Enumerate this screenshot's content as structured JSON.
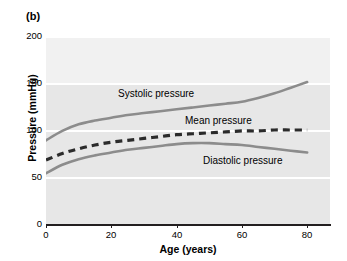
{
  "figure": {
    "panel_label": "(b)"
  },
  "chart_data": {
    "type": "line",
    "title": "",
    "subtitle": "",
    "xlabel": "Age (years)",
    "ylabel": "Pressure (mmHg)",
    "xlim": [
      0,
      87
    ],
    "ylim": [
      0,
      200
    ],
    "xticks": [
      0,
      20,
      40,
      60,
      80
    ],
    "xtick_labels": [
      "0",
      "20",
      "40",
      "60",
      "80"
    ],
    "yticks": [
      0,
      50,
      100,
      150,
      200
    ],
    "ytick_labels": [
      "0",
      "50",
      "100",
      "150",
      "200"
    ],
    "grid": "horizontal-white-gridlines",
    "legend_position": "inline-annotations",
    "plot_background": "#e7e7e7",
    "gridline_color": "#ffffff",
    "series": [
      {
        "name": "Systolic pressure",
        "label": "Systolic pressure",
        "style": "solid",
        "color": "#8c8c8c",
        "x": [
          0,
          5,
          10,
          15,
          20,
          25,
          30,
          35,
          40,
          45,
          50,
          55,
          60,
          65,
          70,
          75,
          80
        ],
        "values": [
          89,
          99,
          106,
          110,
          113,
          116,
          118,
          120,
          122,
          124,
          126,
          128,
          130,
          134,
          139,
          145,
          151
        ]
      },
      {
        "name": "Mean pressure",
        "label": "Mean pressure",
        "style": "dashed",
        "color": "#2b2b2b",
        "x": [
          0,
          5,
          10,
          15,
          20,
          25,
          30,
          35,
          40,
          45,
          50,
          55,
          60,
          65,
          70,
          75,
          80
        ],
        "values": [
          68,
          75,
          80,
          84,
          87,
          89,
          91,
          93,
          95,
          96,
          97,
          98,
          99,
          99,
          100,
          100,
          100
        ]
      },
      {
        "name": "Diastolic pressure",
        "label": "Diastolic pressure",
        "style": "solid",
        "color": "#8c8c8c",
        "x": [
          0,
          5,
          10,
          15,
          20,
          25,
          30,
          35,
          40,
          45,
          50,
          55,
          60,
          65,
          70,
          75,
          80
        ],
        "values": [
          54,
          63,
          69,
          73,
          76,
          79,
          81,
          83,
          85,
          86,
          86,
          85,
          84,
          82,
          80,
          78,
          76
        ]
      }
    ],
    "annotations": [
      {
        "text": "Systolic pressure",
        "x": 24,
        "y": 133
      },
      {
        "text": "Mean pressure",
        "x": 48,
        "y": 116
      },
      {
        "text": "Diastolic pressure",
        "x": 54,
        "y": 70
      }
    ]
  }
}
